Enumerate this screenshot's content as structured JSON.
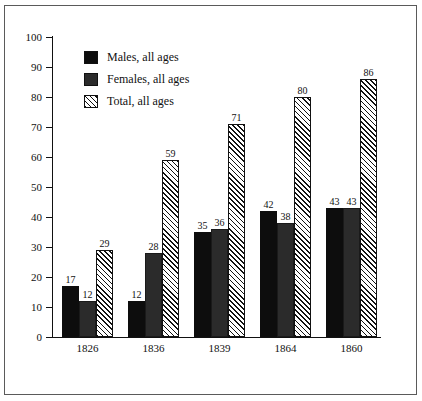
{
  "chart_data": {
    "type": "bar",
    "title": "",
    "subtitle": "",
    "xlabel": "",
    "ylabel": "",
    "categories": [
      "1826",
      "1836",
      "1839",
      "1864",
      "1860"
    ],
    "series": [
      {
        "name": "Males, all ages",
        "key": "males",
        "style": "solid-black",
        "color": "#0d0d0d",
        "values": [
          17,
          12,
          35,
          42,
          43
        ]
      },
      {
        "name": "Females, all ages",
        "key": "females",
        "style": "solid-darkgray",
        "color": "#2b2b2b",
        "values": [
          12,
          28,
          36,
          38,
          43
        ]
      },
      {
        "name": "Total, all ages",
        "key": "total",
        "style": "diagonal-hatch",
        "color": "#ffffff",
        "values": [
          29,
          59,
          71,
          80,
          86
        ]
      }
    ],
    "ylim": [
      0,
      100
    ],
    "ytick_step": 10,
    "yticks": [
      0,
      10,
      20,
      30,
      40,
      50,
      60,
      70,
      80,
      90,
      100
    ],
    "ytick_labels": [
      "0",
      "10",
      "20",
      "30",
      "40",
      "50",
      "60",
      "70",
      "80",
      "90",
      "100"
    ],
    "grid": false,
    "legend_position": "top-left",
    "data_labels": true,
    "groups": [
      {
        "category": "1826",
        "males": 17,
        "females": 12,
        "total": 29
      },
      {
        "category": "1836",
        "males": 31,
        "females": 28,
        "total": 59
      },
      {
        "category": "1839",
        "males": 35,
        "females": 36,
        "total": 71
      },
      {
        "category": "1864",
        "males": 42,
        "females": 38,
        "total": 80
      },
      {
        "category": "1860",
        "males": 43,
        "females": 43,
        "total": 86
      }
    ]
  },
  "legend": {
    "items": [
      {
        "label": "Males, all ages"
      },
      {
        "label": "Females, all ages"
      },
      {
        "label": "Total, all ages"
      }
    ]
  },
  "colors": {
    "males": "#0d0d0d",
    "females": "#2b2b2b",
    "total_fill": "#ffffff",
    "total_hatch": "#111111",
    "axis": "#111111",
    "frame": "#5a5a5a",
    "background": "#ffffff"
  }
}
